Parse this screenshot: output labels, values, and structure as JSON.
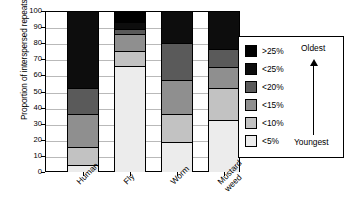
{
  "chart_data": {
    "type": "bar",
    "subtype": "stacked-100-percent",
    "title": "",
    "xlabel": "",
    "ylabel": "Proportion of interspersed repeats (%)",
    "ylim": [
      0,
      100
    ],
    "yticks": [
      0,
      10,
      20,
      30,
      40,
      50,
      60,
      70,
      80,
      90,
      100
    ],
    "ytick_labels": [
      "0",
      "10",
      "20",
      "30",
      "40",
      "50",
      "60",
      "70",
      "80",
      "90",
      "100"
    ],
    "grid": true,
    "legend_position": "right",
    "categories": [
      "Human",
      "Fly",
      "Worm",
      "Mustard weed"
    ],
    "category_labels_multiline": [
      [
        "Human"
      ],
      [
        "Fly"
      ],
      [
        "Worm"
      ],
      [
        "Mustard",
        "weed"
      ]
    ],
    "series": [
      {
        "name": "<5%",
        "color": "#ececec",
        "values": [
          4.5,
          66.0,
          18.5,
          32.0
        ]
      },
      {
        "name": "<10%",
        "color": "#c2c2c2",
        "values": [
          11.0,
          9.0,
          17.5,
          20.0
        ]
      },
      {
        "name": "<15%",
        "color": "#8f8f8f",
        "values": [
          20.5,
          11.0,
          21.0,
          13.0
        ]
      },
      {
        "name": "<20%",
        "color": "#5a5a5a",
        "values": [
          16.0,
          3.0,
          23.0,
          11.5
        ]
      },
      {
        "name": "<25%",
        "color": "#0d0d0d",
        "values": [
          48.0,
          4.0,
          20.0,
          23.5
        ]
      },
      {
        "name": ">25%",
        "color": "#000000",
        "values": [
          0.0,
          7.0,
          0.0,
          0.0
        ]
      }
    ],
    "cumulative_boundaries": {
      "Human": [
        0,
        4.5,
        15.5,
        36.0,
        52.0,
        100.0,
        100.0
      ],
      "Fly": [
        0,
        66.0,
        75.0,
        86.0,
        89.0,
        93.0,
        100.0
      ],
      "Worm": [
        0,
        18.5,
        36.0,
        57.0,
        80.0,
        100.0,
        100.0
      ],
      "Mustard weed": [
        0,
        32.0,
        52.0,
        65.0,
        76.5,
        100.0,
        100.0
      ]
    },
    "annotations": [
      "Oldest",
      "Youngest"
    ]
  },
  "legend": {
    "items": [
      {
        "label": ">25%",
        "color": "#000000"
      },
      {
        "label": "<25%",
        "color": "#0d0d0d"
      },
      {
        "label": "<20%",
        "color": "#5a5a5a"
      },
      {
        "label": "<15%",
        "color": "#8f8f8f"
      },
      {
        "label": "<10%",
        "color": "#c2c2c2"
      },
      {
        "label": "<5%",
        "color": "#ececec"
      }
    ],
    "oldest_label": "Oldest",
    "youngest_label": "Youngest",
    "arrow_icon": "up-arrow-icon"
  }
}
